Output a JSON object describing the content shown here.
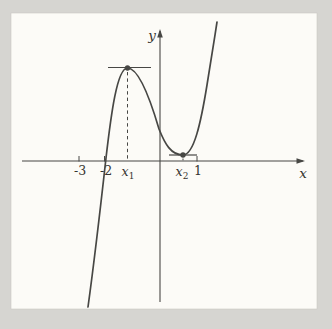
{
  "figure": {
    "name": "cubic-function-graph",
    "background_color": "#d6d5d1",
    "plot_background_color": "#fcfbf7",
    "plot_border_color": "#c9c8c3",
    "ink_color": "#474744",
    "text_color": "#35342f"
  },
  "chart_data": {
    "type": "line",
    "title": "",
    "xlabel": "x",
    "ylabel": "y",
    "x_tick_labels": [
      "-3",
      "-2",
      "x₁",
      "x₂",
      "1"
    ],
    "grid": false,
    "legend": false,
    "annotations": [
      "filled dot with horizontal tangent segment at local maximum x = x₁",
      "filled dot with horizontal tangent segment at local minimum x = x₂",
      "dashed vertical drop line from local maximum to the x-axis",
      "dashed vertical drop line from local minimum to the x-axis"
    ],
    "key_points": [
      {
        "name": "local-maximum",
        "x_label": "x₁",
        "x_approx": -1.2,
        "y_approx": 3.5
      },
      {
        "name": "local-minimum",
        "x_label": "x₂",
        "x_approx": 0.65,
        "y_approx": 0.2
      },
      {
        "name": "x-intercept",
        "x_approx": -2.05,
        "y": 0
      },
      {
        "name": "y-intercept",
        "x": 0,
        "y_approx": 1.2
      }
    ],
    "series": [
      {
        "name": "f(x)",
        "x": [
          -2.6,
          -2.3,
          -2.05,
          -1.7,
          -1.2,
          -0.6,
          0,
          0.3,
          0.65,
          0.9,
          1.1,
          1.3
        ],
        "y": [
          -5.5,
          -2.5,
          0,
          2.4,
          3.5,
          2.6,
          1.2,
          0.5,
          0.2,
          0.8,
          2.2,
          5.0
        ]
      }
    ]
  },
  "render": {
    "size": {
      "width": 332,
      "height": 329
    },
    "plot": {
      "left": 11,
      "top": 13,
      "width": 306,
      "height": 296
    },
    "axes": {
      "x": {
        "y": 161,
        "x1": 22,
        "x2": 297,
        "label": "x",
        "label_x": 303,
        "label_y": 178
      },
      "y": {
        "x": 160,
        "y1": 302,
        "y2": 37,
        "label": "y",
        "label_x": 152,
        "label_y": 40
      }
    },
    "arrows": {
      "x": "305,161 296.5,158.2 296.5,163.8",
      "y": "160,29 157.2,37.5 162.8,37.5"
    },
    "curve_path": "M 88 307 C 95 256 101 203 106 158 C 111 115 117 68 127.5 68 C 138 68 149 95 159 129 C 165 144 171 155 183 155 C 194 155 201 122 207 85 C 211 60 214 42 217 22",
    "ticks": [
      {
        "x": 79,
        "label": {
          "text": "-3"
        },
        "label_x": 80,
        "label_y": 175
      },
      {
        "x": 104.5,
        "label": {
          "text": "-2"
        },
        "label_x": 106,
        "label_y": 175
      },
      {
        "x": 197,
        "label": {
          "text": "1"
        },
        "label_x": 198,
        "label_y": 175
      }
    ],
    "tick_top": 156,
    "extrema": [
      {
        "name": "local-max",
        "dot": [
          127.5,
          68
        ],
        "tangent": [
          108,
          151,
          67.5
        ],
        "dash": [
          127.5,
          72,
          127.5,
          160
        ],
        "dash_pattern": "3.4 3",
        "label": {
          "base": "x",
          "sub": "1"
        },
        "label_x": 128,
        "label_y": 176
      },
      {
        "name": "local-min",
        "dot": [
          183,
          155
        ],
        "tangent": [
          169,
          197,
          155
        ],
        "dash": [
          183,
          158.5,
          183,
          160.5
        ],
        "dash_pattern": "1.8 1.6",
        "label": {
          "base": "x",
          "sub": "2"
        },
        "label_x": 182,
        "label_y": 176
      }
    ],
    "stroke": {
      "curve_width": 1.7,
      "axis_width": 1.1,
      "tangent_width": 1.2,
      "tick_width": 1,
      "dot_radius": 2.7,
      "tick_font_size": 12.5,
      "axis_label_font_size": 13.5,
      "sub_font_size": 9
    }
  }
}
